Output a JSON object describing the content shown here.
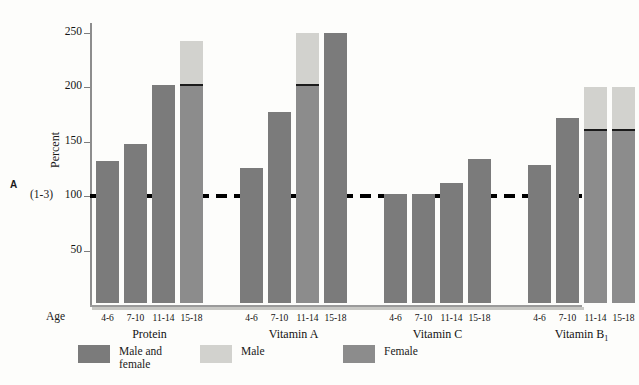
{
  "panel_letter": "A",
  "axis": {
    "ylabel": "Percent",
    "ref_prefix": "(1-3)",
    "yticks": [
      50,
      100,
      150,
      200,
      250
    ],
    "age_caption": "Age"
  },
  "colors": {
    "male_and_female": "#7b7b7b",
    "male": "#d2d2ce",
    "female": "#8c8c8c",
    "reference_line": "#000000",
    "background": "#fdfdfb"
  },
  "legend": [
    {
      "label": "Male and\nfemale",
      "color": "#7b7b7b"
    },
    {
      "label": "Male",
      "color": "#d2d2ce"
    },
    {
      "label": "Female",
      "color": "#8c8c8c"
    }
  ],
  "chart_data": {
    "type": "bar",
    "title": "",
    "xlabel": "Age",
    "ylabel": "Percent",
    "ylim": [
      0,
      265
    ],
    "yticks": [
      50,
      100,
      150,
      200,
      250
    ],
    "grid": false,
    "legend_position": "bottom",
    "reference_line": {
      "value": 100,
      "style": "dashed",
      "label": "(1-3)"
    },
    "categories": [
      "4-6",
      "7-10",
      "11-14",
      "15-18"
    ],
    "groups": [
      {
        "name": "Protein",
        "bars": [
          {
            "age": "4-6",
            "value": 130,
            "type": "male_and_female"
          },
          {
            "age": "7-10",
            "value": 146,
            "type": "male_and_female"
          },
          {
            "age": "11-14",
            "value": 200,
            "type": "male_and_female"
          },
          {
            "age": "15-18",
            "value": 240,
            "type": "split",
            "male": 240,
            "female": 200
          }
        ]
      },
      {
        "name": "Vitamin A",
        "bars": [
          {
            "age": "4-6",
            "value": 124,
            "type": "male_and_female"
          },
          {
            "age": "7-10",
            "value": 175,
            "type": "male_and_female"
          },
          {
            "age": "11-14",
            "value": 248,
            "type": "split",
            "male": 248,
            "female": 200
          },
          {
            "age": "15-18",
            "value": 248,
            "type": "male_and_female"
          }
        ]
      },
      {
        "name": "Vitamin C",
        "bars": [
          {
            "age": "4-6",
            "value": 100,
            "type": "male_and_female"
          },
          {
            "age": "7-10",
            "value": 100,
            "type": "male_and_female"
          },
          {
            "age": "11-14",
            "value": 110,
            "type": "male_and_female"
          },
          {
            "age": "15-18",
            "value": 132,
            "type": "male_and_female"
          }
        ]
      },
      {
        "name": "Vitamin B₁",
        "bars": [
          {
            "age": "4-6",
            "value": 127,
            "type": "male_and_female"
          },
          {
            "age": "7-10",
            "value": 170,
            "type": "male_and_female"
          },
          {
            "age": "11-14",
            "value": 198,
            "type": "split",
            "male": 198,
            "female": 159
          },
          {
            "age": "15-18",
            "value": 198,
            "type": "split",
            "male": 198,
            "female": 159
          }
        ]
      }
    ]
  }
}
